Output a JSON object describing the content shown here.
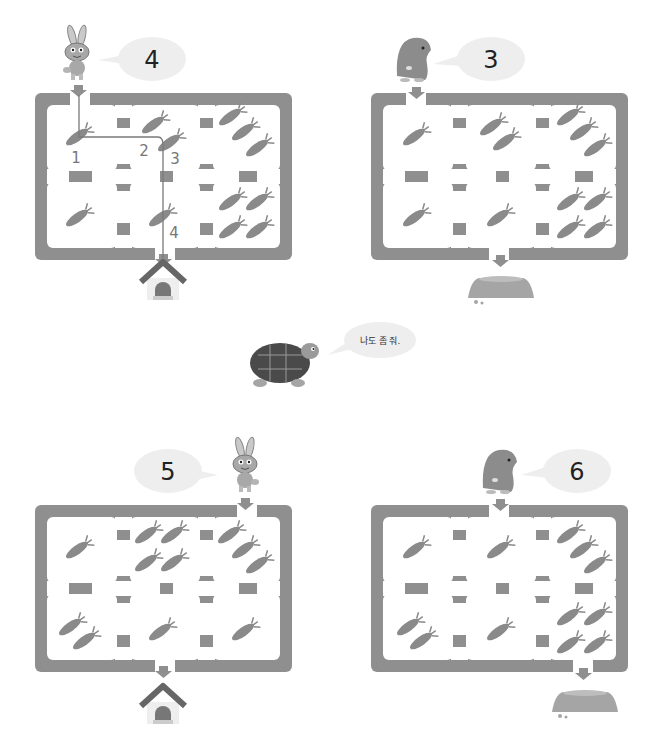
{
  "colors": {
    "maze_wall": "#8f8f8f",
    "cell_fill": "#ffffff",
    "carrot": "#8a8a8a",
    "bubble": "#eeeeee",
    "path_line": "#7a7a7a",
    "roof": "#666666"
  },
  "puzzles": [
    {
      "id": "puzzle-1",
      "character": "rabbit",
      "bubble_number": "4",
      "goal": "house",
      "carrots_per_cell": [
        [
          1,
          1,
          3
        ],
        [
          1,
          1,
          4
        ]
      ],
      "solved_path_labels": [
        "1",
        "2",
        "3",
        "4"
      ],
      "note": "example solved"
    },
    {
      "id": "puzzle-2",
      "character": "mole",
      "bubble_number": "3",
      "goal": "mound",
      "carrots_per_cell": [
        [
          1,
          2,
          3
        ],
        [
          1,
          1,
          4
        ]
      ]
    },
    {
      "id": "puzzle-3",
      "character": "rabbit",
      "bubble_number": "5",
      "goal": "house",
      "carrots_per_cell": [
        [
          1,
          4,
          3
        ],
        [
          2,
          1,
          1
        ]
      ]
    },
    {
      "id": "puzzle-4",
      "character": "mole",
      "bubble_number": "6",
      "goal": "mound",
      "carrots_per_cell": [
        [
          1,
          1,
          3
        ],
        [
          2,
          1,
          4
        ]
      ]
    }
  ],
  "turtle": {
    "speech": "나도 좀 줘."
  }
}
